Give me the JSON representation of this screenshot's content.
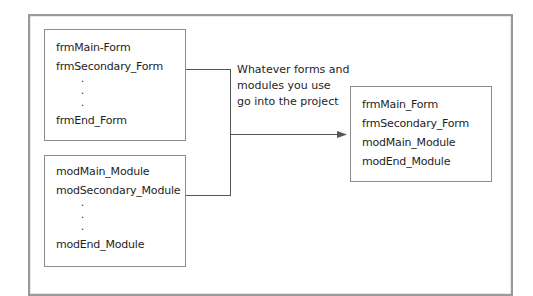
{
  "diagram": {
    "forms_box": {
      "items": [
        "frmMain-Form",
        "frmSecondary_Form",
        "frmEnd_Form"
      ],
      "ellipsis": [
        ".",
        ".",
        "."
      ]
    },
    "modules_box": {
      "items": [
        "modMain_Module",
        "modSecondary_Module",
        "modEnd_Module"
      ],
      "ellipsis": [
        ".",
        ".",
        "."
      ]
    },
    "caption": {
      "lines": [
        "Whatever forms and",
        "modules you use",
        "go into the project"
      ]
    },
    "project_box": {
      "items": [
        "frmMain_Form",
        "frmSecondary_Form",
        "modMain_Module",
        "modEnd_Module"
      ]
    },
    "colors": {
      "border": "#8c8c8c",
      "line": "#555555",
      "text": "#1e1e1e"
    }
  }
}
